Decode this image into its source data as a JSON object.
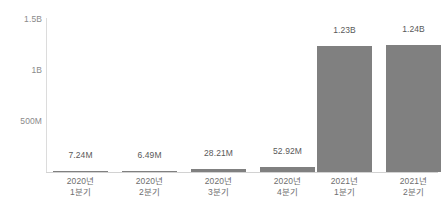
{
  "chart_data": {
    "type": "bar",
    "title": "",
    "subtitle": "",
    "xlabel": "",
    "ylabel": "",
    "categories": [
      "2020년 1분기",
      "2020년 2분기",
      "2020년 3분기",
      "2020년 4분기",
      "2021년 1분기",
      "2021년 2분기"
    ],
    "category_lines": [
      {
        "line1": "2020년",
        "line2": "1분기"
      },
      {
        "line1": "2020년",
        "line2": "2분기"
      },
      {
        "line1": "2020년",
        "line2": "3분기"
      },
      {
        "line1": "2020년",
        "line2": "4분기"
      },
      {
        "line1": "2021년",
        "line2": "1분기"
      },
      {
        "line1": "2021년",
        "line2": "2분기"
      }
    ],
    "values": [
      7240000,
      6490000,
      28210000,
      52920000,
      1230000000,
      1240000000
    ],
    "data_labels": [
      "7.24M",
      "6.49M",
      "28.21M",
      "52.92M",
      "1.23B",
      "1.24B"
    ],
    "ylim": [
      0,
      1500000000
    ],
    "yticks": [
      500000000,
      1000000000,
      1500000000
    ],
    "ytick_labels": [
      "500M",
      "1B",
      "1.5B"
    ],
    "grid": false,
    "legend": null,
    "legend_position": "none",
    "bar_color": "#808080",
    "label_color": "#595959",
    "tick_color": "#8a8a8a",
    "axis_color": "#d2d2d2",
    "background_color": "#ffffff"
  }
}
